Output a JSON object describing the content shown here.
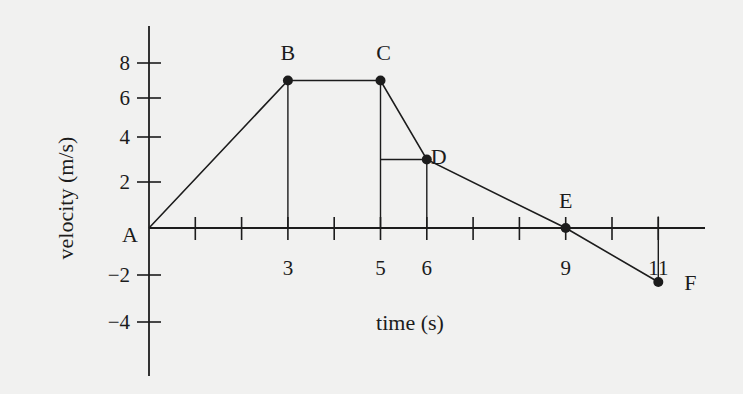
{
  "chart_data": {
    "type": "line",
    "title": "",
    "xlabel": "time (s)",
    "ylabel": "velocity (m/s)",
    "x_ticks": [
      1,
      2,
      3,
      4,
      5,
      6,
      7,
      8,
      9,
      10,
      11
    ],
    "x_tick_labels": [
      "3",
      "5",
      "6",
      "9",
      "11"
    ],
    "x_tick_label_values": [
      3,
      5,
      6,
      9,
      11
    ],
    "y_ticks": [
      8,
      6,
      4,
      2,
      -2,
      -4
    ],
    "y_tick_labels": [
      "8",
      "6",
      "4",
      "2",
      "−2",
      "−4"
    ],
    "xlim": [
      0,
      12
    ],
    "ylim": [
      -6,
      9
    ],
    "grid": false,
    "legend": null,
    "series": [
      {
        "name": "velocity",
        "points": [
          {
            "label": "A",
            "x": 0,
            "y": 0
          },
          {
            "label": "B",
            "x": 3,
            "y": 7
          },
          {
            "label": "C",
            "x": 5,
            "y": 7
          },
          {
            "label": "D",
            "x": 6,
            "y": 3
          },
          {
            "label": "E",
            "x": 9,
            "y": 0
          },
          {
            "label": "F",
            "x": 11,
            "y": -2.3
          }
        ]
      }
    ],
    "guides": [
      {
        "type": "vertical",
        "x": 3,
        "from_y": 0,
        "to_y": 7
      },
      {
        "type": "vertical",
        "x": 5,
        "from_y": 0,
        "to_y": 7
      },
      {
        "type": "vertical",
        "x": 6,
        "from_y": 0,
        "to_y": 3
      },
      {
        "type": "horizontal",
        "y": 3,
        "from_x": 5,
        "to_x": 6
      },
      {
        "type": "vertical",
        "x": 11,
        "from_y": 0.5,
        "to_y": -2.3
      }
    ]
  },
  "colors": {
    "background": "#f1f1f0",
    "ink": "#1c1c1c"
  }
}
